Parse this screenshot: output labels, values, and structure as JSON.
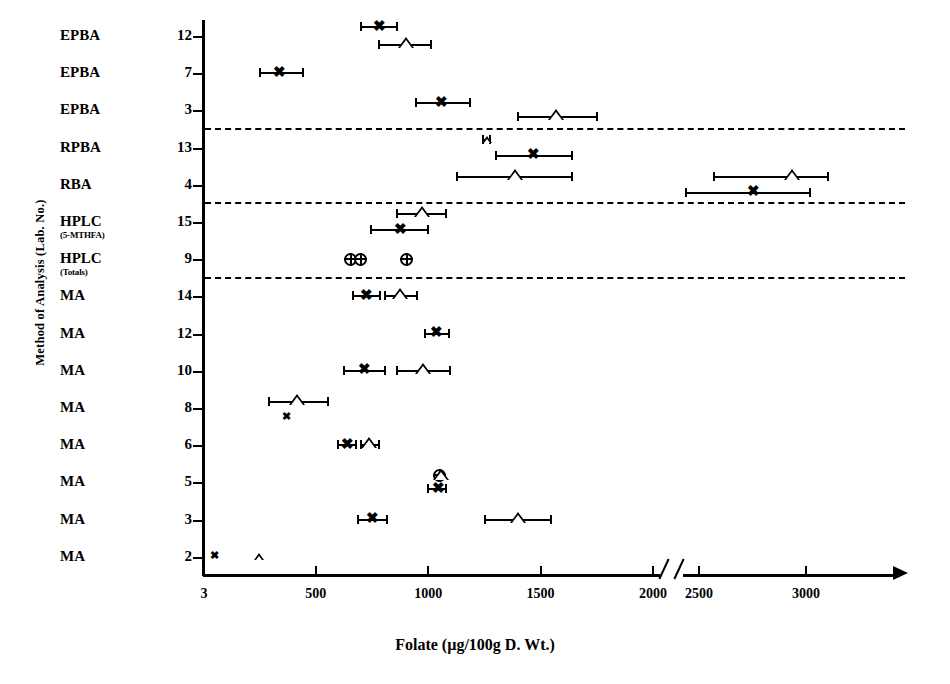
{
  "chart_data": {
    "type": "scatter",
    "title": "",
    "xlabel": "Folate (µg/100g D. Wt.)",
    "ylabel": "Method of Analysis (Lab. No.)",
    "xlim": [
      3,
      3300
    ],
    "axis_break": {
      "from": 2050,
      "to": 2430
    },
    "grid": false,
    "legend": "none",
    "xticks": [
      {
        "label": "3",
        "value": 3
      },
      {
        "label": "500",
        "value": 500
      },
      {
        "label": "1000",
        "value": 1000
      },
      {
        "label": "1500",
        "value": 1500
      },
      {
        "label": "2000",
        "value": 2000
      },
      {
        "label": "2500",
        "value": 2500
      },
      {
        "label": "3000",
        "value": 3000
      }
    ],
    "categories": [
      {
        "method": "EPBA",
        "lab": "12",
        "sub": ""
      },
      {
        "method": "EPBA",
        "lab": "7",
        "sub": ""
      },
      {
        "method": "EPBA",
        "lab": "3",
        "sub": ""
      },
      {
        "method": "RPBA",
        "lab": "13",
        "sub": ""
      },
      {
        "method": "RBA",
        "lab": "4",
        "sub": ""
      },
      {
        "method": "HPLC",
        "lab": "15",
        "sub": "(5-MTHFA)"
      },
      {
        "method": "HPLC",
        "lab": "9",
        "sub": "(Totals)"
      },
      {
        "method": "MA",
        "lab": "14",
        "sub": ""
      },
      {
        "method": "MA",
        "lab": "12",
        "sub": ""
      },
      {
        "method": "MA",
        "lab": "10",
        "sub": ""
      },
      {
        "method": "MA",
        "lab": "8",
        "sub": ""
      },
      {
        "method": "MA",
        "lab": "6",
        "sub": ""
      },
      {
        "method": "MA",
        "lab": "5",
        "sub": ""
      },
      {
        "method": "MA",
        "lab": "3",
        "sub": ""
      },
      {
        "method": "MA",
        "lab": "2",
        "sub": ""
      }
    ],
    "group_separators_after": [
      "EPBA 3",
      "RBA 4",
      "HPLC 9"
    ],
    "series": [
      {
        "name": "x-marker",
        "symbol": "x"
      },
      {
        "name": "triangle-marker",
        "symbol": "triangle"
      },
      {
        "name": "circle-marker",
        "symbol": "circle"
      }
    ],
    "points": [
      {
        "row": 0,
        "symbol": "x",
        "value": 790,
        "low": 700,
        "high": 870,
        "offset": -9
      },
      {
        "row": 0,
        "symbol": "triangle",
        "value": 905,
        "low": 780,
        "high": 1020,
        "offset": 9
      },
      {
        "row": 1,
        "symbol": "x",
        "value": 345,
        "low": 250,
        "high": 450,
        "offset": 0
      },
      {
        "row": 2,
        "symbol": "x",
        "value": 1065,
        "low": 945,
        "high": 1195,
        "offset": -7
      },
      {
        "row": 2,
        "symbol": "triangle",
        "value": 1575,
        "low": 1400,
        "high": 1760,
        "offset": 7
      },
      {
        "row": 3,
        "symbol": "triangle",
        "value": 1265,
        "low": 1245,
        "high": 1285,
        "offset": -8
      },
      {
        "row": 3,
        "symbol": "x",
        "value": 1475,
        "low": 1300,
        "high": 1650,
        "offset": 8
      },
      {
        "row": 4,
        "symbol": "triangle",
        "value": 1390,
        "low": 1130,
        "high": 1650,
        "offset": -8
      },
      {
        "row": 4,
        "symbol": "triangle",
        "value": 2940,
        "low": 2570,
        "high": 3110,
        "offset": -8
      },
      {
        "row": 4,
        "symbol": "x",
        "value": 2760,
        "low": 2440,
        "high": 3030,
        "offset": 8
      },
      {
        "row": 5,
        "symbol": "triangle",
        "value": 975,
        "low": 860,
        "high": 1090,
        "offset": -8
      },
      {
        "row": 5,
        "symbol": "x",
        "value": 880,
        "low": 745,
        "high": 1010,
        "offset": 8
      },
      {
        "row": 6,
        "symbol": "circle",
        "value": 660,
        "low": null,
        "high": null,
        "offset": 0
      },
      {
        "row": 6,
        "symbol": "circle",
        "value": 705,
        "low": null,
        "high": null,
        "offset": 0
      },
      {
        "row": 6,
        "symbol": "circle",
        "value": 910,
        "low": null,
        "high": null,
        "offset": 0
      },
      {
        "row": 7,
        "symbol": "x",
        "value": 730,
        "low": 665,
        "high": 795,
        "offset": 0
      },
      {
        "row": 7,
        "symbol": "triangle",
        "value": 880,
        "low": 810,
        "high": 960,
        "offset": 0
      },
      {
        "row": 8,
        "symbol": "x",
        "value": 1040,
        "low": 985,
        "high": 1100,
        "offset": 0
      },
      {
        "row": 9,
        "symbol": "x",
        "value": 720,
        "low": 625,
        "high": 815,
        "offset": 0
      },
      {
        "row": 9,
        "symbol": "triangle",
        "value": 980,
        "low": 860,
        "high": 1105,
        "offset": 0
      },
      {
        "row": 10,
        "symbol": "x",
        "value": 375,
        "low": null,
        "high": null,
        "offset": 9
      },
      {
        "row": 10,
        "symbol": "triangle",
        "value": 420,
        "low": 290,
        "high": 565,
        "offset": -6
      },
      {
        "row": 11,
        "symbol": "x",
        "value": 645,
        "low": 600,
        "high": 690,
        "offset": 0
      },
      {
        "row": 11,
        "symbol": "triangle",
        "value": 740,
        "low": 700,
        "high": 790,
        "offset": 0
      },
      {
        "row": 12,
        "symbol": "circle",
        "value": 1055,
        "low": null,
        "high": null,
        "offset": -7
      },
      {
        "row": 12,
        "symbol": "triangle",
        "value": 1060,
        "low": null,
        "high": null,
        "offset": -5
      },
      {
        "row": 12,
        "symbol": "x",
        "value": 1050,
        "low": 1000,
        "high": 1090,
        "offset": 7
      },
      {
        "row": 13,
        "symbol": "x",
        "value": 755,
        "low": 690,
        "high": 825,
        "offset": 0
      },
      {
        "row": 13,
        "symbol": "triangle",
        "value": 1405,
        "low": 1255,
        "high": 1555,
        "offset": 0
      },
      {
        "row": 14,
        "symbol": "x",
        "value": 55,
        "low": null,
        "high": null,
        "offset": 0
      },
      {
        "row": 14,
        "symbol": "triangle",
        "value": 250,
        "low": null,
        "high": null,
        "offset": 0
      }
    ]
  }
}
